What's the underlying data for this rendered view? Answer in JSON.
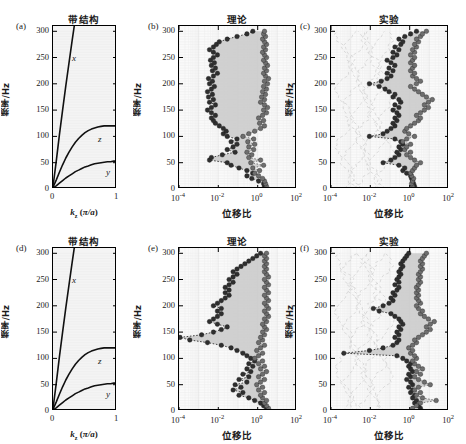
{
  "figure": {
    "rows": 2,
    "cols": 3,
    "ylabel": "频率/Hz",
    "xlabel_band": "k_z (π/a)",
    "xlabel_ratio": "位移比",
    "title_band": "带结构",
    "title_theory": "理论",
    "title_experiment": "实验",
    "yticks": [
      "0",
      "50",
      "100",
      "150",
      "200",
      "250",
      "300"
    ],
    "ylim": [
      0,
      310
    ],
    "band_xticks": [
      "0",
      "1"
    ],
    "ratio_xticks": [
      "10-4",
      "10-2",
      "100",
      "102"
    ],
    "ratio_xticks_exp": [
      "-4",
      "-2",
      "0",
      "2"
    ],
    "ratio_xlim_log": [
      -4,
      2
    ],
    "colors": {
      "curve": "#111111",
      "marker_dark": "#2f2f2f",
      "marker_gray": "#6e6e6e",
      "band_fill": "#c9c9c9",
      "axes_bg": "#fafafa",
      "ghost": "#cfcfcf"
    }
  },
  "panels": [
    {
      "id": "a",
      "label": "(a)",
      "type": "band",
      "title": "带结构",
      "curve_labels": [
        {
          "name": "x",
          "x": 0.3,
          "y": 248
        },
        {
          "name": "z",
          "x": 0.71,
          "y": 93
        },
        {
          "name": "y",
          "x": 0.83,
          "y": 31
        }
      ]
    },
    {
      "id": "b",
      "label": "(b)",
      "type": "ratio",
      "title": "理论",
      "series_names": [
        "left-branch",
        "right-branch"
      ]
    },
    {
      "id": "c",
      "label": "(c)",
      "type": "ratio",
      "title": "实验",
      "series_names": [
        "left-branch",
        "right-branch"
      ],
      "has_ghost": true
    },
    {
      "id": "d",
      "label": "(d)",
      "type": "band",
      "title": "带结构",
      "curve_labels": [
        {
          "name": "x",
          "x": 0.3,
          "y": 248
        },
        {
          "name": "z",
          "x": 0.71,
          "y": 93
        },
        {
          "name": "y",
          "x": 0.83,
          "y": 31
        }
      ]
    },
    {
      "id": "e",
      "label": "(e)",
      "type": "ratio",
      "title": "理论",
      "series_names": [
        "left-branch",
        "right-branch"
      ]
    },
    {
      "id": "f",
      "label": "(f)",
      "type": "ratio",
      "title": "实验",
      "series_names": [
        "left-branch",
        "right-branch"
      ],
      "has_ghost": true
    }
  ],
  "chart_data": {
    "type": "line",
    "xlabel": "位移比 / k_z (π/a)",
    "ylabel": "频率/Hz",
    "ylim": [
      0,
      310
    ],
    "band_curves_a": {
      "xlabel": "k_z (π/a)",
      "xlim": [
        0,
        1
      ],
      "x": [
        0,
        0.05,
        0.1,
        0.15,
        0.2,
        0.25,
        0.3,
        0.35,
        0.4,
        0.45,
        0.5,
        0.55,
        0.6,
        0.65,
        0.7,
        0.75,
        0.8,
        0.85,
        0.9,
        0.95,
        1.0
      ],
      "series": [
        {
          "name": "x",
          "values": [
            5,
            52,
            103,
            150,
            196,
            240,
            283,
            325,
            367,
            408,
            449,
            489,
            529,
            569,
            608,
            647,
            686,
            724,
            762,
            800,
            838
          ]
        },
        {
          "name": "z",
          "values": [
            3,
            17,
            32,
            46,
            59,
            70,
            80,
            89,
            96,
            102,
            107,
            111,
            114,
            116,
            118,
            119,
            120,
            120,
            120,
            120,
            120
          ]
        },
        {
          "name": "y",
          "values": [
            2,
            6,
            11,
            16,
            21,
            25,
            29,
            33,
            36,
            39,
            42,
            44,
            46,
            48,
            49,
            50,
            51,
            52,
            52,
            53,
            53
          ]
        }
      ]
    },
    "band_curves_d": {
      "xlabel": "k_z (π/a)",
      "xlim": [
        0,
        1
      ],
      "x": [
        0,
        0.05,
        0.1,
        0.15,
        0.2,
        0.25,
        0.3,
        0.35,
        0.4,
        0.45,
        0.5,
        0.55,
        0.6,
        0.65,
        0.7,
        0.75,
        0.8,
        0.85,
        0.9,
        0.95,
        1.0
      ],
      "series": [
        {
          "name": "x",
          "values": [
            5,
            52,
            103,
            150,
            196,
            240,
            283,
            325,
            367,
            408,
            449,
            489,
            529,
            569,
            608,
            647,
            686,
            724,
            762,
            800,
            838
          ]
        },
        {
          "name": "z",
          "values": [
            3,
            17,
            32,
            46,
            59,
            70,
            80,
            89,
            96,
            102,
            107,
            111,
            114,
            116,
            118,
            119,
            120,
            120,
            120,
            120,
            120
          ]
        },
        {
          "name": "y",
          "values": [
            2,
            6,
            11,
            16,
            21,
            25,
            29,
            33,
            36,
            39,
            42,
            44,
            46,
            48,
            49,
            50,
            51,
            52,
            52,
            53,
            53
          ]
        }
      ]
    },
    "ratio_b": {
      "xlabel": "位移比",
      "xlim_log10": [
        -4,
        2
      ],
      "freq": [
        5,
        10,
        15,
        20,
        25,
        30,
        35,
        40,
        45,
        50,
        55,
        60,
        65,
        70,
        75,
        80,
        85,
        90,
        95,
        100,
        105,
        110,
        115,
        120,
        125,
        130,
        135,
        140,
        145,
        150,
        155,
        160,
        165,
        170,
        175,
        180,
        185,
        190,
        195,
        200,
        205,
        210,
        215,
        220,
        225,
        230,
        235,
        240,
        245,
        250,
        255,
        260,
        265,
        270,
        275,
        280,
        285,
        290,
        295,
        300
      ],
      "series": [
        {
          "name": "left-branch",
          "log10_values": [
            0.35,
            0.3,
            0.05,
            -0.3,
            -0.55,
            -0.25,
            -0.55,
            -0.95,
            -1.35,
            -1.55,
            -2.45,
            -2.35,
            -1.8,
            -1.15,
            -1.55,
            -1.25,
            -1.05,
            -1.35,
            -1.05,
            -1.55,
            -1.75,
            -1.6,
            -1.75,
            -1.95,
            -2.15,
            -2.25,
            -2.35,
            -2.15,
            -2.35,
            -2.55,
            -2.35,
            -2.15,
            -2.45,
            -2.25,
            -2.5,
            -2.3,
            -2.55,
            -2.35,
            -2.2,
            -2.45,
            -2.3,
            -2.5,
            -2.25,
            -2.05,
            -2.3,
            -2.15,
            -2.35,
            -2.2,
            -2.4,
            -2.25,
            -2.05,
            -2.25,
            -2.45,
            -2.25,
            -2.1,
            -1.95,
            -1.55,
            -1.05,
            -0.55,
            -0.25
          ]
        },
        {
          "name": "right-branch",
          "log10_values": [
            0.45,
            0.4,
            0.35,
            0.25,
            0.05,
            -0.15,
            0.1,
            -0.25,
            0.3,
            -0.35,
            0.15,
            -0.45,
            -0.3,
            -0.55,
            -0.2,
            -0.45,
            -0.15,
            -0.5,
            -0.2,
            -0.75,
            -0.45,
            -0.15,
            0.15,
            0.35,
            0.1,
            0.3,
            0.05,
            0.25,
            0.45,
            0.3,
            0.5,
            0.35,
            0.15,
            0.35,
            0.2,
            0.4,
            0.25,
            0.45,
            0.3,
            0.5,
            0.35,
            0.55,
            0.4,
            0.3,
            0.45,
            0.35,
            0.5,
            0.4,
            0.3,
            0.45,
            0.35,
            0.25,
            0.4,
            0.3,
            0.45,
            0.35,
            0.25,
            0.4,
            0.3,
            0.35
          ]
        }
      ]
    },
    "ratio_c": {
      "xlabel": "位移比",
      "xlim_log10": [
        -4,
        2
      ],
      "freq": [
        5,
        10,
        15,
        20,
        25,
        30,
        35,
        40,
        45,
        50,
        55,
        60,
        65,
        70,
        75,
        80,
        85,
        90,
        95,
        100,
        105,
        110,
        115,
        120,
        125,
        130,
        135,
        140,
        145,
        150,
        155,
        160,
        165,
        170,
        175,
        180,
        185,
        190,
        195,
        200,
        205,
        210,
        215,
        220,
        225,
        230,
        235,
        240,
        245,
        250,
        255,
        260,
        265,
        270,
        275,
        280,
        285,
        290,
        295,
        300
      ],
      "series": [
        {
          "name": "left-branch",
          "log10_values": [
            0.25,
            0.2,
            0.15,
            0.1,
            0.05,
            -0.15,
            -0.35,
            -0.25,
            -0.55,
            -1.35,
            -0.95,
            -0.75,
            -0.55,
            -0.65,
            -0.45,
            -0.55,
            -0.35,
            -0.45,
            -0.75,
            -2.05,
            -1.35,
            -1.15,
            -0.95,
            -0.75,
            -0.85,
            -0.65,
            -0.75,
            -0.55,
            -0.65,
            -0.85,
            -0.55,
            -0.75,
            -0.45,
            -0.55,
            -0.85,
            -0.75,
            -1.05,
            -1.25,
            -1.55,
            -2.05,
            -1.45,
            -1.15,
            -0.95,
            -1.15,
            -0.85,
            -1.05,
            -0.75,
            -0.95,
            -1.15,
            -0.85,
            -0.65,
            -0.85,
            -0.55,
            -0.75,
            -0.45,
            -0.35,
            -0.55,
            -0.25,
            0.05,
            0.35
          ]
        },
        {
          "name": "right-branch",
          "log10_values": [
            0.15,
            0.1,
            0.15,
            0.2,
            0.1,
            0.05,
            0.15,
            0.25,
            0.35,
            0.55,
            0.25,
            0.05,
            -0.15,
            0.05,
            -0.25,
            -0.15,
            0.05,
            -0.35,
            -0.15,
            0.25,
            -0.05,
            -0.25,
            -0.15,
            0.05,
            0.25,
            0.45,
            0.55,
            0.35,
            0.55,
            0.75,
            0.95,
            0.75,
            0.95,
            1.15,
            0.85,
            0.65,
            0.45,
            0.25,
            0.05,
            0.35,
            0.55,
            0.35,
            0.15,
            0.25,
            0.05,
            0.15,
            0.25,
            0.05,
            0.15,
            0.25,
            0.05,
            0.25,
            0.15,
            0.35,
            0.25,
            0.45,
            0.35,
            0.55,
            0.65,
            0.85
          ]
        }
      ]
    },
    "ratio_e": {
      "xlabel": "位移比",
      "xlim_log10": [
        -4,
        2
      ],
      "freq": [
        5,
        10,
        15,
        20,
        25,
        30,
        35,
        40,
        45,
        50,
        55,
        60,
        65,
        70,
        75,
        80,
        85,
        90,
        95,
        100,
        105,
        110,
        115,
        120,
        125,
        130,
        135,
        140,
        145,
        150,
        155,
        160,
        165,
        170,
        175,
        180,
        185,
        190,
        195,
        200,
        205,
        210,
        215,
        220,
        225,
        230,
        235,
        240,
        245,
        250,
        255,
        260,
        265,
        270,
        275,
        280,
        285,
        290,
        295,
        300
      ],
      "series": [
        {
          "name": "left-branch",
          "log10_values": [
            0.45,
            0.3,
            0.15,
            -0.15,
            -0.45,
            -0.95,
            -0.75,
            -1.25,
            -0.85,
            -1.15,
            -0.55,
            -0.95,
            -0.45,
            -0.75,
            -0.35,
            -0.55,
            -0.25,
            -0.45,
            -0.15,
            -0.35,
            -0.55,
            -0.75,
            -1.05,
            -1.35,
            -1.85,
            -2.55,
            -3.45,
            -3.95,
            -2.85,
            -2.25,
            -1.85,
            -1.55,
            -2.05,
            -2.45,
            -2.25,
            -2.05,
            -1.85,
            -2.05,
            -1.85,
            -2.25,
            -2.05,
            -1.85,
            -1.65,
            -1.45,
            -1.65,
            -1.45,
            -1.65,
            -1.45,
            -1.25,
            -1.45,
            -1.25,
            -1.05,
            -1.25,
            -1.05,
            -0.85,
            -0.65,
            -0.45,
            -0.25,
            -0.05,
            0.15
          ]
        },
        {
          "name": "right-branch",
          "log10_values": [
            0.55,
            0.45,
            0.35,
            0.45,
            0.25,
            0.15,
            0.35,
            0.05,
            0.25,
            -0.05,
            0.15,
            0.35,
            0.05,
            0.25,
            0.45,
            0.15,
            0.35,
            0.05,
            0.25,
            -0.15,
            0.05,
            0.25,
            -0.05,
            0.15,
            0.35,
            0.05,
            0.25,
            0.15,
            0.35,
            0.25,
            0.45,
            0.35,
            0.25,
            0.45,
            0.35,
            0.55,
            0.45,
            0.35,
            0.55,
            0.45,
            0.35,
            0.55,
            0.45,
            0.35,
            0.55,
            0.45,
            0.35,
            0.55,
            0.45,
            0.35,
            0.55,
            0.45,
            0.35,
            0.45,
            0.35,
            0.45,
            0.35,
            0.45,
            0.35,
            0.45
          ]
        }
      ]
    },
    "ratio_f": {
      "xlabel": "位移比",
      "xlim_log10": [
        -4,
        2
      ],
      "freq": [
        5,
        10,
        15,
        20,
        25,
        30,
        35,
        40,
        45,
        50,
        55,
        60,
        65,
        70,
        75,
        80,
        85,
        90,
        95,
        100,
        105,
        110,
        115,
        120,
        125,
        130,
        135,
        140,
        145,
        150,
        155,
        160,
        165,
        170,
        175,
        180,
        185,
        190,
        195,
        200,
        205,
        210,
        215,
        220,
        225,
        230,
        235,
        240,
        245,
        250,
        255,
        260,
        265,
        270,
        275,
        280,
        285,
        290,
        295,
        300
      ],
      "series": [
        {
          "name": "left-branch",
          "log10_values": [
            0.55,
            0.45,
            0.25,
            0.35,
            0.15,
            0.25,
            0.05,
            0.15,
            -0.05,
            0.15,
            0.05,
            -0.15,
            0.05,
            -0.05,
            0.15,
            0.05,
            -0.05,
            0.05,
            -0.15,
            -0.35,
            -0.65,
            -3.35,
            -2.05,
            -1.35,
            -0.85,
            -0.65,
            -0.55,
            -0.75,
            -0.55,
            -0.65,
            -0.45,
            -0.55,
            -0.35,
            -0.45,
            -0.55,
            -0.75,
            -0.95,
            -1.55,
            -1.85,
            -1.35,
            -1.05,
            -0.85,
            -0.95,
            -0.75,
            -0.85,
            -0.65,
            -0.55,
            -0.75,
            -0.55,
            -0.65,
            -0.55,
            -0.45,
            -0.55,
            -0.45,
            -0.35,
            -0.45,
            -0.35,
            -0.25,
            -0.15,
            -0.05
          ]
        },
        {
          "name": "right-branch",
          "log10_values": [
            0.15,
            0.35,
            0.55,
            1.35,
            0.65,
            0.35,
            0.55,
            0.25,
            0.45,
            1.05,
            0.75,
            0.45,
            0.25,
            0.55,
            0.35,
            0.65,
            0.45,
            0.25,
            0.15,
            0.35,
            0.25,
            0.05,
            0.15,
            -0.05,
            0.15,
            0.35,
            0.25,
            0.45,
            0.65,
            0.85,
            1.05,
            0.85,
            1.05,
            1.25,
            0.95,
            0.75,
            0.55,
            0.65,
            0.45,
            0.35,
            0.55,
            0.45,
            0.35,
            0.45,
            0.35,
            0.45,
            0.35,
            0.45,
            0.55,
            0.45,
            0.55,
            0.45,
            0.55,
            0.65,
            0.55,
            0.65,
            0.55,
            0.65,
            0.75,
            0.85
          ]
        }
      ]
    }
  }
}
